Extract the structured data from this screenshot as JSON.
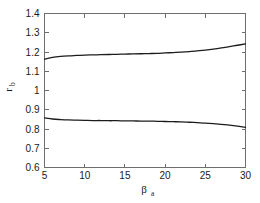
{
  "chart_data": {
    "type": "line",
    "title": "",
    "subtitle": "",
    "xlabel": "β",
    "xlabel_sub": "a",
    "ylabel": "r",
    "ylabel_sub": "b",
    "xlim": [
      5,
      30
    ],
    "ylim": [
      0.6,
      1.4
    ],
    "xticks": [
      5,
      10,
      15,
      20,
      25,
      30
    ],
    "xtick_labels": [
      "5",
      "10",
      "15",
      "20",
      "25",
      "30"
    ],
    "yticks": [
      0.6,
      0.7,
      0.8,
      0.9,
      1.0,
      1.1,
      1.2,
      1.3,
      1.4
    ],
    "ytick_labels": [
      "0.6",
      "0.7",
      "0.8",
      "0.9",
      "1",
      "1.1",
      "1.2",
      "1.3",
      "1.4"
    ],
    "grid": false,
    "legend": null,
    "legend_position": "none",
    "line_color": "#1c1c1c",
    "axis_color": "#6e6e6e",
    "background_color": "#ffffff",
    "x": [
      5,
      6,
      7,
      8,
      9,
      10,
      11,
      12,
      13,
      14,
      15,
      16,
      17,
      18,
      19,
      20,
      21,
      22,
      23,
      24,
      25,
      26,
      27,
      28,
      29,
      30
    ],
    "series": [
      {
        "name": "upper branch",
        "values": [
          1.163,
          1.172,
          1.177,
          1.18,
          1.182,
          1.184,
          1.185,
          1.186,
          1.187,
          1.188,
          1.189,
          1.19,
          1.191,
          1.192,
          1.193,
          1.195,
          1.197,
          1.199,
          1.202,
          1.206,
          1.21,
          1.215,
          1.221,
          1.228,
          1.235,
          1.242
        ]
      },
      {
        "name": "lower branch",
        "values": [
          0.858,
          0.852,
          0.849,
          0.847,
          0.846,
          0.845,
          0.844,
          0.844,
          0.843,
          0.843,
          0.842,
          0.842,
          0.841,
          0.841,
          0.84,
          0.839,
          0.838,
          0.837,
          0.835,
          0.833,
          0.831,
          0.828,
          0.824,
          0.82,
          0.815,
          0.809
        ]
      }
    ],
    "annotations": []
  }
}
